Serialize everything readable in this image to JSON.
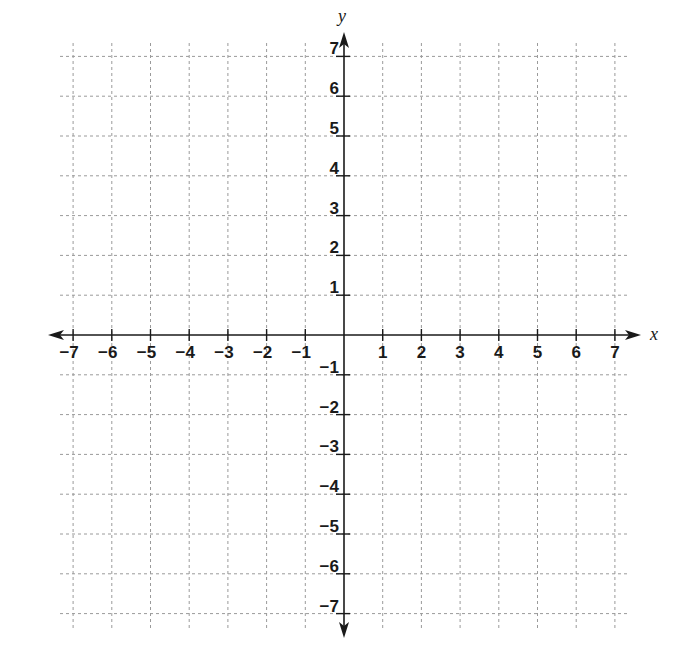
{
  "chart_data": {
    "type": "scatter",
    "title": "",
    "xlabel": "x",
    "ylabel": "y",
    "xlim": [
      -7,
      7
    ],
    "ylim": [
      -7,
      7
    ],
    "grid": true,
    "grid_style": "dashed",
    "x_ticks": [
      -7,
      -6,
      -5,
      -4,
      -3,
      -2,
      -1,
      1,
      2,
      3,
      4,
      5,
      6,
      7
    ],
    "y_ticks": [
      -7,
      -6,
      -5,
      -4,
      -3,
      -2,
      -1,
      1,
      2,
      3,
      4,
      5,
      6,
      7
    ],
    "x_tick_labels": [
      "−7",
      "−6",
      "−5",
      "−4",
      "−3",
      "−2",
      "−1",
      "1",
      "2",
      "3",
      "4",
      "5",
      "6",
      "7"
    ],
    "y_tick_labels": [
      "−7",
      "−6",
      "−5",
      "−4",
      "−3",
      "−2",
      "−1",
      "1",
      "2",
      "3",
      "4",
      "5",
      "6",
      "7"
    ],
    "series": [],
    "legend": null,
    "colors": {
      "axis": "#1a1a1a",
      "grid": "#9a9a9a",
      "background": "#ffffff"
    }
  }
}
